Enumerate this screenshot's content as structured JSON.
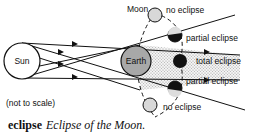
{
  "diagram": {
    "labels": {
      "sun": "Sun",
      "earth": "Earth",
      "moon": "Moon",
      "no_eclipse_top": "no eclipse",
      "partial_eclipse_top": "partial eclipse",
      "total_eclipse": "total eclipse",
      "partial_eclipse_bottom": "partial eclipse",
      "no_eclipse_bottom": "no eclipse",
      "scale_note": "(not to scale)"
    },
    "colors": {
      "earth_fill": "#a8a8a8",
      "moon_fill": "#d8d8d8",
      "shadow_fill": "#000000",
      "umbra_hatch": "#bbbbbb"
    }
  },
  "caption": {
    "term": "eclipse",
    "text": "Eclipse of the Moon."
  }
}
